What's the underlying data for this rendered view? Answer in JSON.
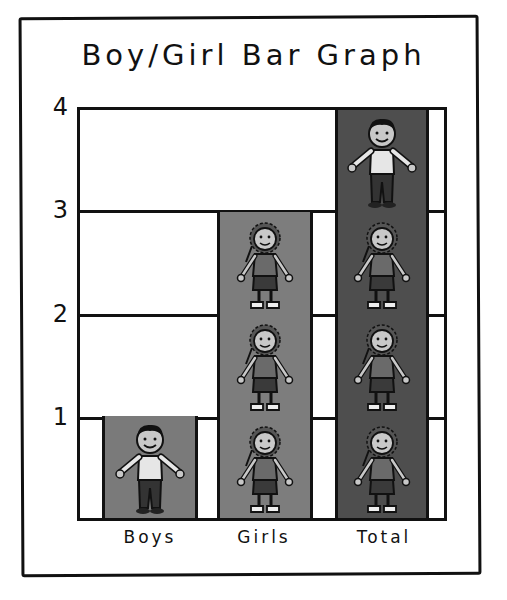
{
  "chart_data": {
    "type": "bar",
    "title": "Boy/Girl Bar Graph",
    "categories": [
      "Boys",
      "Girls",
      "Total"
    ],
    "values": [
      1,
      3,
      4
    ],
    "series": [
      {
        "name": "Girls",
        "values": [
          0,
          3,
          3
        ]
      },
      {
        "name": "Boys",
        "values": [
          1,
          0,
          1
        ]
      }
    ],
    "xlabel": "",
    "ylabel": "",
    "ylim": [
      0,
      4
    ],
    "yticks": [
      1,
      2,
      3,
      4
    ],
    "grid": true,
    "legend": "none",
    "pictograph": {
      "Boys": [
        "boy"
      ],
      "Girls": [
        "girl",
        "girl",
        "girl"
      ],
      "Total": [
        "girl",
        "girl",
        "girl",
        "boy"
      ]
    }
  },
  "colors": {
    "bar_boys": "#7a7a7a",
    "bar_girls": "#7d7d7d",
    "bar_total": "#4e4e4e",
    "ink": "#111111",
    "background": "#ffffff"
  }
}
